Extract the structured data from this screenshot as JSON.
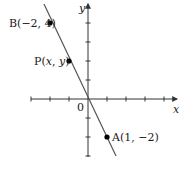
{
  "diagram": {
    "type": "coordinate-plane",
    "unit_px": 19,
    "origin_px": [
      88,
      99
    ],
    "axes": {
      "x_label": "x",
      "y_label": "y",
      "origin_label": "0",
      "x_ticks": [
        -3,
        -2,
        -1,
        1,
        2,
        3,
        4
      ],
      "y_ticks": [
        4,
        3,
        2,
        1,
        -1,
        -2,
        -3
      ],
      "x_range": [
        -3,
        4.6
      ],
      "y_range": [
        -3,
        5.2
      ]
    },
    "line": {
      "slope": -2,
      "intercept": 0,
      "from": [
        -2.3,
        4.9
      ],
      "to": [
        1.5,
        -3.0
      ]
    },
    "points": [
      {
        "id": "B",
        "label": "B(−2, 4)",
        "x": -2,
        "y": 4
      },
      {
        "id": "P",
        "label_prefix": "P(",
        "label_var_x": "x",
        "label_sep": ", ",
        "label_var_y": "y",
        "label_suffix": ")",
        "x": -1,
        "y": 2
      },
      {
        "id": "A",
        "label": "A(1, −2)",
        "x": 1,
        "y": -2
      }
    ],
    "colors": {
      "axis": "#333333",
      "line": "#555555",
      "point": "#000000",
      "text": "#1a1a1a"
    }
  }
}
